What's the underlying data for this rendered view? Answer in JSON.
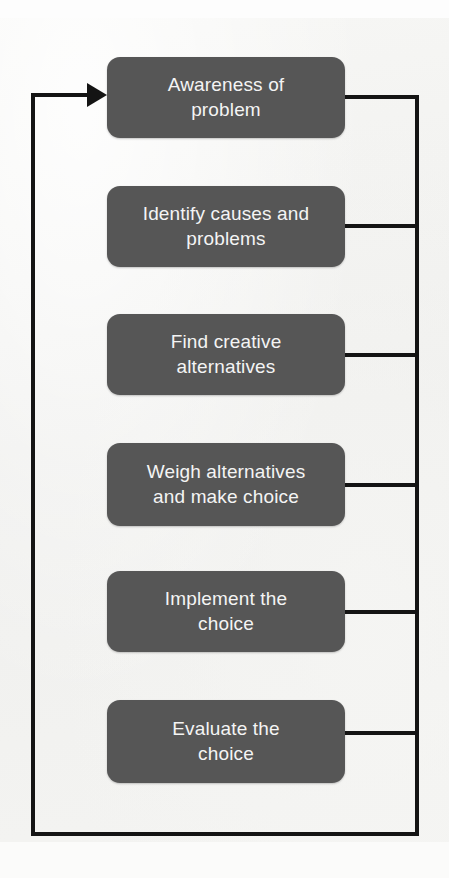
{
  "diagram": {
    "background_color": "#f2f2f0",
    "node_fill_color": "#565656",
    "node_text_color": "#f4f4f4",
    "line_color": "#141414",
    "steps": [
      {
        "id": "step-1",
        "label": "Awareness of\nproblem"
      },
      {
        "id": "step-2",
        "label": "Identify causes and\nproblems"
      },
      {
        "id": "step-3",
        "label": "Find creative\nalternatives"
      },
      {
        "id": "step-4",
        "label": "Weigh alternatives\nand make choice"
      },
      {
        "id": "step-5",
        "label": "Implement the\nchoice"
      },
      {
        "id": "step-6",
        "label": "Evaluate the\nchoice"
      }
    ],
    "feedback": {
      "description": "Feedback loop returning to first step",
      "arrow_target": "step-1"
    }
  }
}
